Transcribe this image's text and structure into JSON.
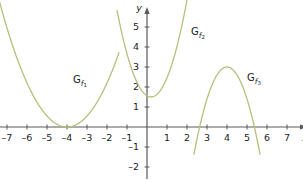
{
  "figure": {
    "background_color": "#ffffff",
    "curve_color": "#b5c07c",
    "axis_color": "#595959",
    "text_color": "#1a1a26",
    "width": 303,
    "height": 180
  },
  "axes": {
    "x_axis_label": "x",
    "y_axis_label": "y",
    "origin_px": [
      147,
      127
    ],
    "unit_px": 20,
    "x_ticks": [
      -7,
      -6,
      -5,
      -4,
      -3,
      -2,
      -1,
      1,
      2,
      3,
      4,
      5,
      6,
      7
    ],
    "x_tick_labels": [
      "–7",
      "–6",
      "–5",
      "–4",
      "–3",
      "–2",
      "–1",
      "1",
      "2",
      "3",
      "4",
      "5",
      "6",
      "7"
    ],
    "y_ticks": [
      -2,
      -1,
      1,
      2,
      3,
      4,
      5
    ],
    "y_tick_labels": [
      "–2",
      "–1",
      "1",
      "2",
      "3",
      "4",
      "5"
    ],
    "xlim": [
      -7.6,
      7.6
    ],
    "ylim": [
      -2.6,
      5.6
    ],
    "grid": false
  },
  "chart_data": {
    "type": "line",
    "title": "",
    "xlabel": "x",
    "ylabel": "y",
    "xlim": [
      -7.6,
      7.6
    ],
    "ylim": [
      -2.6,
      5.6
    ],
    "grid": false,
    "legend_position": "inline-annotations",
    "series": [
      {
        "name": "G_f1",
        "label": "G",
        "label_sub": "f",
        "label_subsub": "1",
        "label_pos": [
          -3.7,
          2.2
        ],
        "form": "parabola",
        "direction": "up",
        "vertex": [
          -4,
          0
        ],
        "a": 0.55,
        "x_range": [
          -7.4,
          -1.4
        ],
        "roots": [
          -4,
          -4
        ],
        "y_intercept": 8.8
      },
      {
        "name": "G_f2",
        "label": "G",
        "label_sub": "f",
        "label_subsub": "2",
        "label_pos": [
          2.2,
          4.6
        ],
        "form": "parabola",
        "direction": "up",
        "vertex": [
          0.2,
          1.5
        ],
        "a": 1.5,
        "x_range": [
          -1.5,
          2.0
        ],
        "roots": [],
        "y_intercept": 1.56
      },
      {
        "name": "G_f3",
        "label": "G",
        "label_sub": "f",
        "label_subsub": "3",
        "label_pos": [
          5.0,
          2.3
        ],
        "form": "parabola",
        "direction": "down",
        "vertex": [
          4,
          3
        ],
        "a": -1.6,
        "x_range": [
          2.35,
          5.65
        ],
        "roots": [
          2.63,
          5.37
        ],
        "y_intercept": -22.6
      }
    ]
  }
}
